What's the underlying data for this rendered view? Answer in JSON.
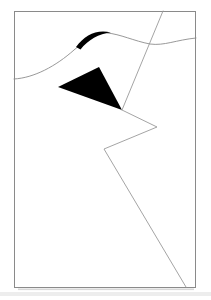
{
  "artwork": {
    "title": "Abstract line drawing",
    "background_color": "#ffffff",
    "frame": {
      "name": "border-frame",
      "x": 14,
      "y": 11,
      "width": 182,
      "height": 277,
      "stroke_color": "#8a8a8a",
      "stroke_width": 1
    },
    "elements": [
      {
        "id": "wave-curve",
        "label": "wavy-horizon-curve",
        "stroke_color": "#8d8d8d",
        "path": "M 14 79 C 34 78, 56 66, 74 50 C 88 38, 97 32, 107 33 C 120 34, 134 41, 150 44 C 164 46, 176 40, 196 38"
      },
      {
        "id": "wave-swell",
        "label": "thick-brushstroke-swell",
        "fill_color": "#000000",
        "path": "M 77 45 C 86 35, 97 30, 110 33 C 99 34, 88 40, 80 48 Z"
      },
      {
        "id": "solid-triangle",
        "label": "filled-black-triangle",
        "fill_color": "#000000",
        "points": "58,87 99,67 122,110"
      },
      {
        "id": "diagonal-line",
        "label": "top-diagonal-line",
        "stroke_color": "#9a9a9a",
        "path": "M 163 11 L 122 110"
      },
      {
        "id": "zigzag-line",
        "label": "zigzag-polyline",
        "stroke_color": "#9a9a9a",
        "path": "M 122 110 L 157 127 L 104 149 L 186 287"
      }
    ],
    "footer_strip": {
      "name": "baseline-shadow-strip",
      "color": "#d8d8d8"
    }
  }
}
